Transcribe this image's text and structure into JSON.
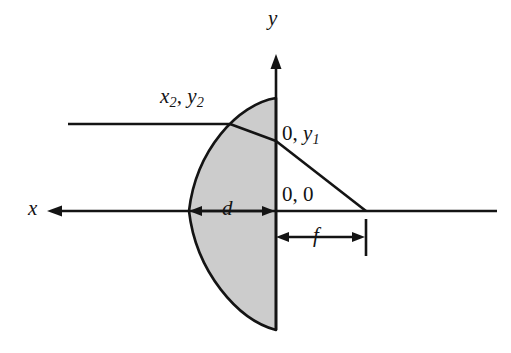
{
  "figure": {
    "background_color": "#ffffff",
    "stroke_color": "#141414",
    "lens_fill_color": "#cccccc"
  },
  "axes": {
    "x_label": "x",
    "y_label": "y",
    "x_axis_arrow_direction": "left",
    "y_axis_arrow_direction": "up"
  },
  "labels": {
    "surface_point": {
      "var1": "x",
      "sub1": "2",
      "sep": ", ",
      "var2": "y",
      "sub2": "2"
    },
    "exit_point": {
      "value": "0, ",
      "var": "y",
      "sub": "1"
    },
    "origin": "0, 0",
    "thickness": "d",
    "focal_length": "f"
  },
  "dimensions": {
    "thickness_symbol": "d",
    "focal_symbol": "f"
  }
}
